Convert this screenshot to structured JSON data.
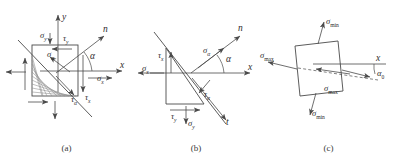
{
  "figure": {
    "line_color": "#4a4a4a",
    "hatch_color": "#7a7a7a",
    "text_color": "#2e2e2e"
  },
  "panels": [
    {
      "id": "a",
      "caption": "(a)",
      "description": "Stress element with inclined cutting plane and normal n",
      "axes": [
        {
          "name": "y-axis",
          "label": "y"
        },
        {
          "name": "x-axis",
          "label": "x"
        }
      ],
      "labels": [
        {
          "name": "sigma-y",
          "symbol": "σ",
          "sub": "y"
        },
        {
          "name": "tau-y",
          "symbol": "τ",
          "sub": "y"
        },
        {
          "name": "sigma-alpha",
          "symbol": "σ",
          "sub": "α"
        },
        {
          "name": "tau-alpha",
          "symbol": "τ",
          "sub": "α"
        },
        {
          "name": "tau-x",
          "symbol": "τ",
          "sub": "x"
        },
        {
          "name": "sigma-x",
          "symbol": "σ",
          "sub": "x"
        },
        {
          "name": "normal-n",
          "symbol": "n",
          "sub": ""
        },
        {
          "name": "angle-alpha",
          "symbol": "α",
          "sub": ""
        }
      ]
    },
    {
      "id": "b",
      "caption": "(b)",
      "description": "Free-body wedge cut from the element showing stresses on each face",
      "axes": [
        {
          "name": "x-axis",
          "label": "x"
        },
        {
          "name": "t-axis",
          "label": "t"
        }
      ],
      "labels": [
        {
          "name": "tau-x",
          "symbol": "τ",
          "sub": "x"
        },
        {
          "name": "sigma-x",
          "symbol": "σ",
          "sub": "x"
        },
        {
          "name": "sigma-alpha",
          "symbol": "σ",
          "sub": "α"
        },
        {
          "name": "tau-alpha",
          "symbol": "τ",
          "sub": "α"
        },
        {
          "name": "tau-y",
          "symbol": "τ",
          "sub": "y"
        },
        {
          "name": "sigma-y",
          "symbol": "σ",
          "sub": "y"
        },
        {
          "name": "normal-n",
          "symbol": "n",
          "sub": ""
        },
        {
          "name": "angle-alpha",
          "symbol": "α",
          "sub": ""
        }
      ]
    },
    {
      "id": "c",
      "caption": "(c)",
      "description": "Principal stress element rotated by alpha-zero from the x axis",
      "axes": [
        {
          "name": "x-axis",
          "label": "x"
        }
      ],
      "labels": [
        {
          "name": "sigma-min-top",
          "symbol": "σ",
          "sub": "min"
        },
        {
          "name": "sigma-max-left",
          "symbol": "σ",
          "sub": "max"
        },
        {
          "name": "sigma-min-bottom",
          "symbol": "σ",
          "sub": "min"
        },
        {
          "name": "sigma-max-right",
          "symbol": "σ",
          "sub": "max"
        },
        {
          "name": "angle-alpha-zero",
          "symbol": "α",
          "sub": "0"
        }
      ]
    }
  ],
  "text": {
    "sigma": "σ",
    "tau": "τ",
    "alpha": "α",
    "sub_x": "x",
    "sub_y": "y",
    "sub_alpha": "α",
    "sub_min": "min",
    "sub_max": "max",
    "sub_zero": "0",
    "axis_x": "x",
    "axis_y": "y",
    "axis_t": "t",
    "axis_n": "n",
    "cap_a": "(a)",
    "cap_b": "(b)",
    "cap_c": "(c)"
  }
}
